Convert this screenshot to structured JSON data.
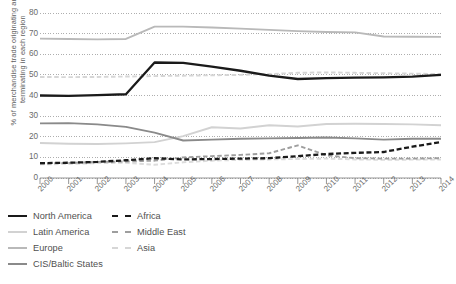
{
  "chart_data": {
    "type": "line",
    "title": "",
    "xlabel": "",
    "ylabel": "% of merchandise trade originating and terminating in each region",
    "ylim": [
      0,
      80
    ],
    "yticks": [
      0,
      10,
      20,
      30,
      40,
      50,
      60,
      70,
      80
    ],
    "grid": true,
    "legend_position": "bottom-left",
    "categories": [
      "2000",
      "2001",
      "2002",
      "2003",
      "2004",
      "2005",
      "2006",
      "2007",
      "2008",
      "2009",
      "2010",
      "2011",
      "2012",
      "2013",
      "2014"
    ],
    "series": [
      {
        "name": "North America",
        "color": "#1a1a1a",
        "style": "solid",
        "values": [
          40.0,
          39.8,
          40.2,
          40.6,
          56.0,
          55.8,
          54.0,
          52.0,
          49.6,
          48.0,
          48.4,
          48.7,
          48.8,
          49.2,
          50.0
        ]
      },
      {
        "name": "Latin America",
        "color": "#d2d2d2",
        "style": "solid",
        "values": [
          17.0,
          16.6,
          16.5,
          16.8,
          17.4,
          20.3,
          24.6,
          24.0,
          25.6,
          25.0,
          26.2,
          26.3,
          26.2,
          26.0,
          25.6
        ]
      },
      {
        "name": "Europe",
        "color": "#b9b9b9",
        "style": "solid",
        "values": [
          67.6,
          67.4,
          67.2,
          67.4,
          73.4,
          73.4,
          73.0,
          72.4,
          71.8,
          71.2,
          70.8,
          70.6,
          68.6,
          68.5,
          68.4
        ]
      },
      {
        "name": "CIS/Baltic States",
        "color": "#8a8a8a",
        "style": "solid",
        "values": [
          26.5,
          26.6,
          26.0,
          24.8,
          22.0,
          18.2,
          18.6,
          19.0,
          19.2,
          19.4,
          19.6,
          19.2,
          18.6,
          19.0,
          19.0
        ]
      },
      {
        "name": "Africa",
        "color": "#1a1a1a",
        "style": "dashed",
        "values": [
          7.2,
          7.4,
          7.8,
          8.6,
          9.6,
          9.0,
          9.2,
          9.4,
          9.6,
          10.6,
          11.6,
          12.2,
          12.6,
          15.2,
          17.4
        ]
      },
      {
        "name": "Middle East",
        "color": "#9e9e9e",
        "style": "dashed",
        "values": [
          7.0,
          7.3,
          7.8,
          8.0,
          8.4,
          10.0,
          10.6,
          11.2,
          12.0,
          15.8,
          11.0,
          9.6,
          9.4,
          9.4,
          9.6
        ]
      },
      {
        "name": "Asia",
        "color": "#d6d6d6",
        "style": "dashed",
        "values": [
          49.0,
          48.9,
          49.0,
          49.2,
          49.4,
          49.6,
          49.8,
          50.0,
          50.4,
          51.0,
          51.2,
          51.0,
          50.8,
          50.6,
          50.4
        ]
      },
      {
        "name": "Asia low",
        "color": "#dcdcdc",
        "style": "dashed",
        "hidden_from_legend": true,
        "values": [
          6.6,
          6.8,
          7.2,
          7.4,
          6.4,
          7.6,
          8.4,
          8.8,
          9.0,
          9.2,
          9.4,
          9.0,
          8.8,
          8.9,
          9.0
        ]
      }
    ]
  },
  "axis": {
    "y_label": "% of merchandise trade originating and terminating in each region",
    "y_ticks": [
      "80",
      "70",
      "60",
      "50",
      "40",
      "30",
      "20",
      "10",
      "0"
    ],
    "x_ticks": [
      "2000",
      "2001",
      "2002",
      "2003",
      "2004",
      "2005",
      "2006",
      "2007",
      "2008",
      "2009",
      "2010",
      "2011",
      "2012",
      "2013",
      "2014"
    ]
  },
  "legend": {
    "column1": [
      {
        "label": "North America",
        "color": "#1a1a1a",
        "style": "solid"
      },
      {
        "label": "Latin America",
        "color": "#d2d2d2",
        "style": "solid"
      },
      {
        "label": "Europe",
        "color": "#b9b9b9",
        "style": "solid"
      },
      {
        "label": "CIS/Baltic States",
        "color": "#8a8a8a",
        "style": "solid"
      }
    ],
    "column2": [
      {
        "label": "Africa",
        "color": "#1a1a1a",
        "style": "dashed"
      },
      {
        "label": "Middle East",
        "color": "#9e9e9e",
        "style": "dashed"
      },
      {
        "label": "Asia",
        "color": "#d6d6d6",
        "style": "dashed"
      }
    ]
  }
}
